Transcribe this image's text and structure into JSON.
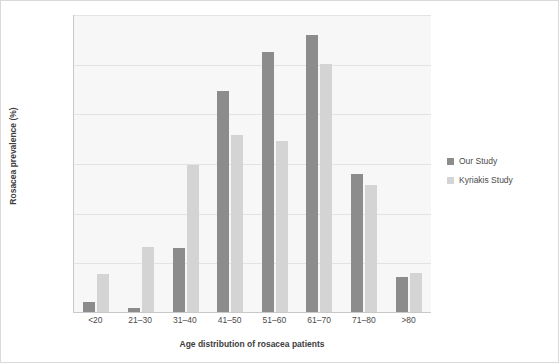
{
  "chart_data": {
    "type": "bar",
    "title": "",
    "xlabel": "Age distribution of rosacea patients",
    "ylabel": "Rosacea prevalence (%)",
    "categories": [
      "<20",
      "21–30",
      "31–40",
      "41–50",
      "51–60",
      "61–70",
      "71–80",
      ">80"
    ],
    "series": [
      {
        "name": "Our Study",
        "color": "#8c8c8c",
        "values": [
          1.0,
          0.4,
          6.4,
          22.2,
          26.2,
          27.9,
          13.9,
          3.5
        ]
      },
      {
        "name": "Kyriakis Study",
        "color": "#d4d4d4",
        "values": [
          3.8,
          6.5,
          14.8,
          17.8,
          17.2,
          25.0,
          12.8,
          3.9
        ]
      }
    ],
    "ylim": [
      0,
      30
    ],
    "ytick_labels": [
      "0.0%",
      "5.0%",
      "10.0%",
      "15.0%",
      "20.0%",
      "25.0%",
      "30.0%"
    ],
    "ytick_values": [
      0,
      5,
      10,
      15,
      20,
      25,
      30
    ],
    "grid": true,
    "legend_position": "right"
  }
}
